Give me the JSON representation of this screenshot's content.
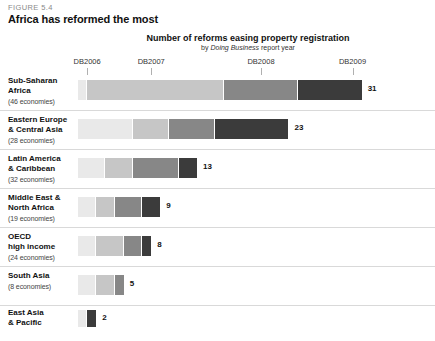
{
  "figure": {
    "label": "FIGURE 5.4",
    "title": "Africa has reformed the most"
  },
  "chart_data": {
    "type": "bar",
    "orientation": "horizontal",
    "stacked": true,
    "title": "Number of reforms easing property registration",
    "subtitle_prefix": "by ",
    "subtitle_italic": "Doing Business",
    "subtitle_suffix": " report year",
    "xlabel": "",
    "ylabel": "",
    "grid": false,
    "legend_position": "none",
    "axis_ticks": [
      {
        "label": "DB2006",
        "value": 1
      },
      {
        "label": "DB2007",
        "value": 8
      },
      {
        "label": "DB2008",
        "value": 20
      },
      {
        "label": "DB2009",
        "value": 30
      }
    ],
    "series": [
      {
        "name": "DB2006",
        "color": "#e9e9e9",
        "values": [
          1,
          6,
          3,
          2,
          2,
          2,
          1
        ]
      },
      {
        "name": "DB2007",
        "color": "#c6c6c6",
        "values": [
          15,
          4,
          3,
          2,
          3,
          2,
          0
        ]
      },
      {
        "name": "DB2008",
        "color": "#878787",
        "values": [
          8,
          5,
          5,
          3,
          2,
          1,
          0
        ]
      },
      {
        "name": "DB2009",
        "color": "#3b3b3b",
        "values": [
          7,
          8,
          2,
          2,
          1,
          0,
          1
        ]
      }
    ],
    "categories": [
      {
        "name": "Sub-Saharan Africa",
        "label_line1": "Sub-Saharan",
        "label_line2": "Africa",
        "economies": "(46 economies)",
        "total": 31,
        "total_label": "31",
        "segments": [
          1,
          15,
          8,
          7
        ]
      },
      {
        "name": "Eastern Europe & Central Asia",
        "label_line1": "Eastern Europe",
        "label_line2": "& Central Asia",
        "economies": "(28 economies)",
        "total": 23,
        "total_label": "23",
        "segments": [
          6,
          4,
          5,
          8
        ]
      },
      {
        "name": "Latin America & Caribbean",
        "label_line1": "Latin America",
        "label_line2": "& Caribbean",
        "economies": "(32 economies)",
        "total": 13,
        "total_label": "13",
        "segments": [
          3,
          3,
          5,
          2
        ]
      },
      {
        "name": "Middle East & North Africa",
        "label_line1": "Middle East &",
        "label_line2": "North Africa",
        "economies": "(19 economies)",
        "total": 9,
        "total_label": "9",
        "segments": [
          2,
          2,
          3,
          2
        ]
      },
      {
        "name": "OECD high income",
        "label_line1": "OECD",
        "label_line2": "high income",
        "economies": "(24 economies)",
        "total": 8,
        "total_label": "8",
        "segments": [
          2,
          3,
          2,
          1
        ]
      },
      {
        "name": "South Asia",
        "label_line1": "South Asia",
        "label_line2": "",
        "economies": "(8 economies)",
        "total": 5,
        "total_label": "5",
        "segments": [
          2,
          2,
          1,
          0
        ]
      },
      {
        "name": "East Asia & Pacific",
        "label_line1": "East Asia",
        "label_line2": "& Pacific",
        "economies": "",
        "total": 2,
        "total_label": "2",
        "segments": [
          1,
          0,
          0,
          1
        ]
      }
    ]
  }
}
